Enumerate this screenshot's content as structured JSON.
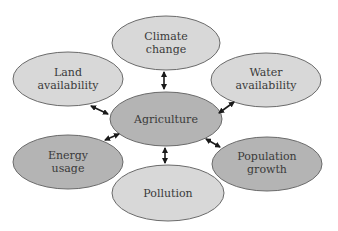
{
  "diagram": {
    "center": {
      "label_lines": [
        "Agriculture"
      ],
      "fill": "#b4b4b4"
    },
    "nodes": [
      {
        "id": "climate",
        "label_lines": [
          "Climate",
          "change"
        ],
        "fill": "#d8d8d8"
      },
      {
        "id": "land",
        "label_lines": [
          "Land",
          "availability"
        ],
        "fill": "#d8d8d8"
      },
      {
        "id": "water",
        "label_lines": [
          "Water",
          "availability"
        ],
        "fill": "#d8d8d8"
      },
      {
        "id": "energy",
        "label_lines": [
          "Energy",
          "usage"
        ],
        "fill": "#b4b4b4"
      },
      {
        "id": "pollution",
        "label_lines": [
          "Pollution"
        ],
        "fill": "#d8d8d8"
      },
      {
        "id": "population",
        "label_lines": [
          "Population",
          "growth"
        ],
        "fill": "#b4b4b4"
      }
    ],
    "edges": [
      {
        "from": "Agriculture",
        "to": "Climate change",
        "type": "bidirectional"
      },
      {
        "from": "Agriculture",
        "to": "Land availability",
        "type": "bidirectional"
      },
      {
        "from": "Agriculture",
        "to": "Water availability",
        "type": "bidirectional"
      },
      {
        "from": "Agriculture",
        "to": "Energy usage",
        "type": "bidirectional"
      },
      {
        "from": "Agriculture",
        "to": "Pollution",
        "type": "bidirectional"
      },
      {
        "from": "Agriculture",
        "to": "Population growth",
        "type": "bidirectional"
      }
    ],
    "stroke": "#6a6a6a",
    "arrow_color": "#1a1a1a"
  }
}
